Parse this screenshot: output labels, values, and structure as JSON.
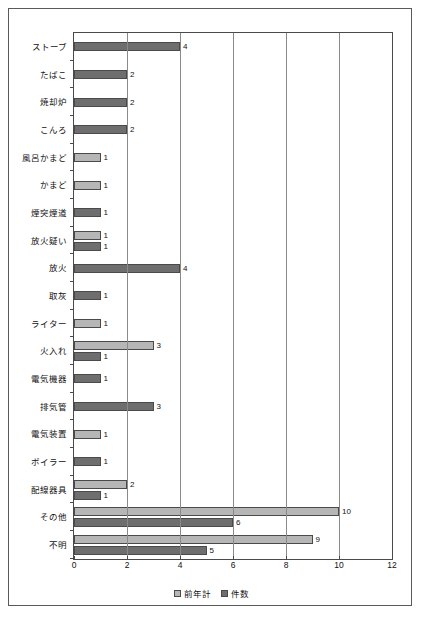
{
  "chart_data": {
    "type": "bar",
    "orientation": "horizontal",
    "title": "",
    "xlabel": "",
    "ylabel": "",
    "xlim": [
      0,
      12
    ],
    "xticks": [
      0,
      2,
      4,
      6,
      8,
      10,
      12
    ],
    "grid": true,
    "legend_position": "bottom",
    "categories": [
      "ストーブ",
      "たばこ",
      "焼却炉",
      "こんろ",
      "風呂かまど",
      "かまど",
      "煙突煙道",
      "放火疑い",
      "放火",
      "取灰",
      "ライター",
      "火入れ",
      "電気機器",
      "排気管",
      "電気装置",
      "ボイラー",
      "配線器具",
      "その他",
      "不明"
    ],
    "series": [
      {
        "name": "前年計",
        "color": "#b6b6b6",
        "values": [
          null,
          null,
          null,
          null,
          1,
          1,
          null,
          1,
          null,
          null,
          1,
          3,
          null,
          null,
          1,
          null,
          2,
          10,
          9
        ]
      },
      {
        "name": "件数",
        "color": "#6e6e6e",
        "values": [
          4,
          2,
          2,
          2,
          null,
          null,
          1,
          1,
          4,
          1,
          null,
          1,
          1,
          3,
          null,
          1,
          1,
          6,
          5
        ]
      }
    ]
  },
  "colors": {
    "prev_year": "#b6b6b6",
    "count": "#6e6e6e",
    "axis": "#4a4a4a",
    "gridline": "#8a8a8a",
    "frame": "#5a5a5a",
    "background": "#ffffff"
  }
}
